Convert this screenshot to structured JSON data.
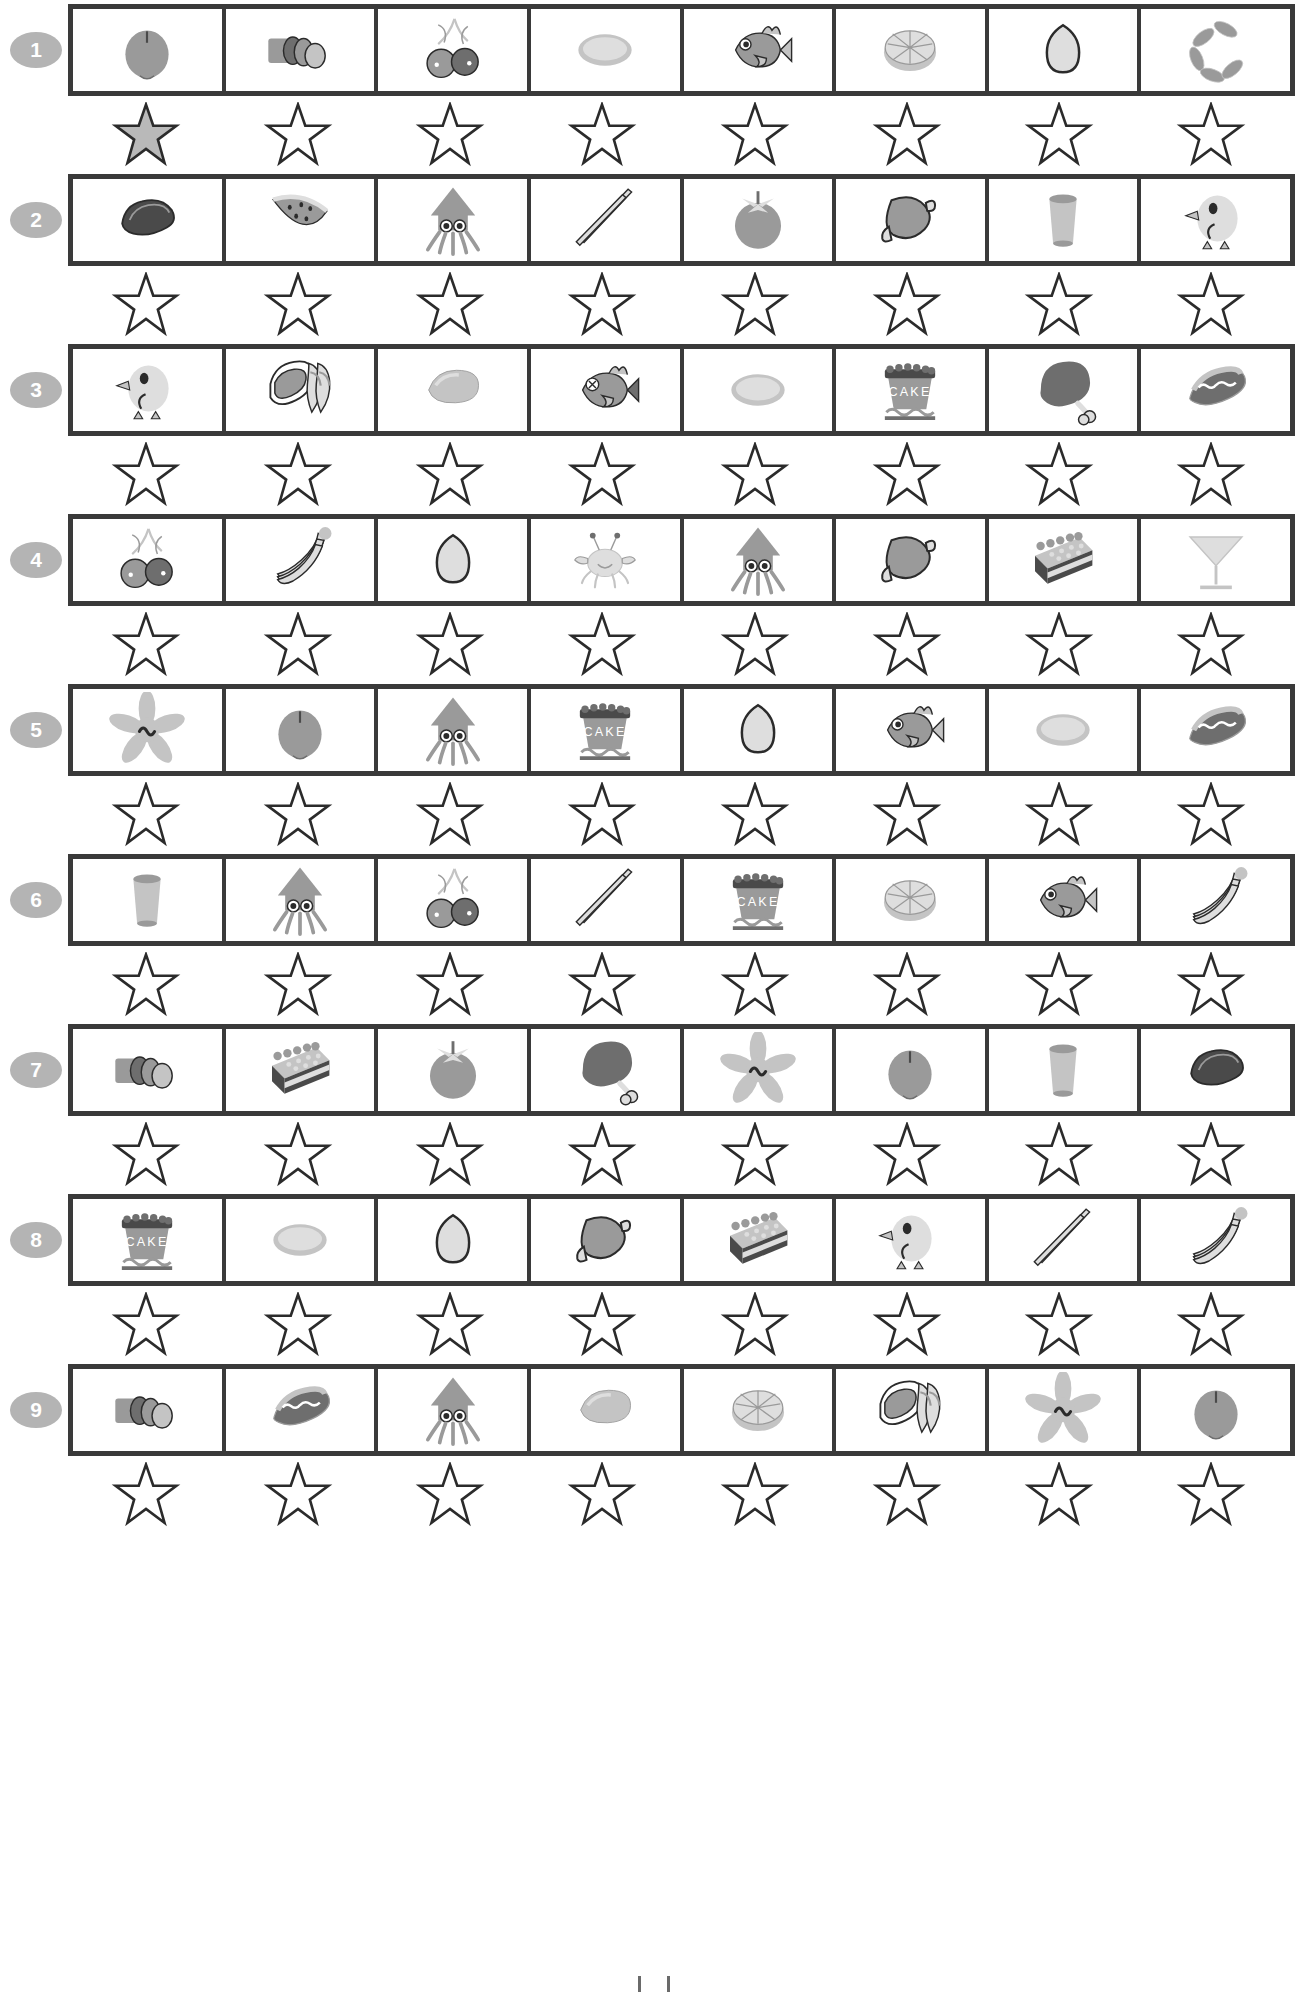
{
  "worksheet": {
    "title": "Food Picture Rating Worksheet",
    "rows_count": 9,
    "cells_per_row": 8,
    "stars_per_row": 8,
    "colors": {
      "border": "#3a3a3a",
      "row_number_bg": "#b4b4b4",
      "row_number_text": "#ffffff",
      "star_outline": "#2b2b2b",
      "star_filled": "#b9b9b9",
      "page_bg": "#ffffff"
    },
    "rows": [
      {
        "number": "1",
        "items": [
          "apple",
          "sausage-slices",
          "cherries",
          "plate",
          "fish",
          "orange-half",
          "egg",
          "sausage-links"
        ],
        "stars": [
          "filled",
          "empty",
          "empty",
          "empty",
          "empty",
          "empty",
          "empty",
          "empty"
        ]
      },
      {
        "number": "2",
        "items": [
          "steak",
          "watermelon",
          "squid",
          "chopsticks",
          "tomato",
          "ham",
          "cup",
          "chick"
        ],
        "stars": [
          "empty",
          "empty",
          "empty",
          "empty",
          "empty",
          "empty",
          "empty",
          "empty"
        ]
      },
      {
        "number": "3",
        "items": [
          "chick",
          "bacon-sandwich",
          "mango",
          "dead-fish",
          "plate",
          "cake",
          "drumstick",
          "hotdog"
        ],
        "stars": [
          "empty",
          "empty",
          "empty",
          "empty",
          "empty",
          "empty",
          "empty",
          "empty"
        ]
      },
      {
        "number": "4",
        "items": [
          "cherries",
          "bananas",
          "egg",
          "crab",
          "squid",
          "ham",
          "cake-slice",
          "martini-glass"
        ],
        "stars": [
          "empty",
          "empty",
          "empty",
          "empty",
          "empty",
          "empty",
          "empty",
          "empty"
        ]
      },
      {
        "number": "5",
        "items": [
          "starfish",
          "apple",
          "squid",
          "cake",
          "egg",
          "fish",
          "plate",
          "hotdog"
        ],
        "stars": [
          "empty",
          "empty",
          "empty",
          "empty",
          "empty",
          "empty",
          "empty",
          "empty"
        ]
      },
      {
        "number": "6",
        "items": [
          "cup",
          "squid",
          "cherries",
          "chopsticks",
          "cake",
          "orange-half",
          "fish",
          "bananas"
        ],
        "stars": [
          "empty",
          "empty",
          "empty",
          "empty",
          "empty",
          "empty",
          "empty",
          "empty"
        ]
      },
      {
        "number": "7",
        "items": [
          "sausage-slices",
          "cake-slice",
          "tomato",
          "drumstick",
          "starfish",
          "apple",
          "cup",
          "steak"
        ],
        "stars": [
          "empty",
          "empty",
          "empty",
          "empty",
          "empty",
          "empty",
          "empty",
          "empty"
        ]
      },
      {
        "number": "8",
        "items": [
          "cake",
          "plate",
          "egg",
          "ham",
          "cake-slice",
          "chick",
          "chopsticks",
          "bananas"
        ],
        "stars": [
          "empty",
          "empty",
          "empty",
          "empty",
          "empty",
          "empty",
          "empty",
          "empty"
        ]
      },
      {
        "number": "9",
        "items": [
          "sausage-slices",
          "hotdog",
          "squid",
          "mango",
          "orange-half",
          "bacon-sandwich",
          "starfish",
          "apple"
        ],
        "stars": [
          "empty",
          "empty",
          "empty",
          "empty",
          "empty",
          "empty",
          "empty",
          "empty"
        ]
      }
    ],
    "cake_label": "CAKE"
  }
}
